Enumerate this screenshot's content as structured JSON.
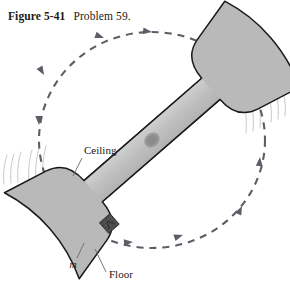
{
  "caption": {
    "figure_number": "Figure 5-41",
    "title": "Problem 59."
  },
  "labels": {
    "ceiling": "Ceiling",
    "floor": "Floor",
    "mass": "m"
  },
  "colors": {
    "body_fill": "#b9b9b9",
    "body_stroke": "#1a1a1a",
    "bar_fill": "#c2c2c2",
    "hub_fill": "#8f8f8f",
    "mass_fill": "#4a4a4a",
    "path_stroke": "#5d5d66",
    "motion_line": "#c8c8c8",
    "leader_stroke": "#6a6a6a",
    "background": "#ffffff",
    "text": "#1a1a1a"
  },
  "diagram": {
    "type": "physics-figure",
    "rotation_direction": "counterclockwise",
    "axis_center_x": 152,
    "axis_center_y": 140,
    "orbit_radius_x": 113,
    "orbit_radius_y": 108,
    "bar_angle_deg": -41,
    "path_arrow_count": 6,
    "icons": {
      "rotation_path": "dashed-circle-icon",
      "rotation_arrow": "arrowhead-icon",
      "pivot": "pivot-hub-icon",
      "mass_block": "mass-square-icon",
      "motion_streaks": "speed-lines-icon"
    }
  }
}
